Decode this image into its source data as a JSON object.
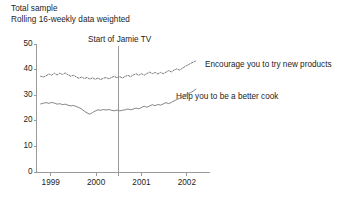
{
  "figure": {
    "background": "#ffffff",
    "ink": "#1d1d1d",
    "axis_color": "#9a9a9a",
    "series_color": "#777777",
    "annotation_color": "#9a9a9a"
  },
  "header": {
    "line1": "Total sample",
    "line2": "Rolling 16-weekly data weighted"
  },
  "annotation": {
    "label": "Start of Jamie TV",
    "x_value": 2000.5
  },
  "labels": {
    "series_0": "Encourage you to try new products",
    "series_1": "Help you to be a better cook"
  },
  "axes": {
    "y_ticks": [
      "0",
      "10",
      "20",
      "30",
      "40",
      "50"
    ],
    "y_tick_values": [
      0,
      10,
      20,
      30,
      40,
      50
    ],
    "x_ticks": [
      "1999",
      "2000",
      "2001",
      "2002"
    ],
    "x_tick_values": [
      1999,
      2000,
      2001,
      2002
    ],
    "ylim": [
      0,
      50
    ],
    "xlim": [
      1998.72,
      2002.4
    ]
  },
  "chart_data": {
    "type": "line",
    "title": "Total sample",
    "subtitle": "Rolling 16-weekly data weighted",
    "xlabel": "",
    "ylabel": "",
    "ylim": [
      0,
      50
    ],
    "xlim": [
      1998.72,
      2002.4
    ],
    "grid": false,
    "legend_position": "inline-right",
    "annotations": [
      {
        "type": "vline",
        "x": 2000.5,
        "label": "Start of Jamie TV"
      }
    ],
    "x": [
      1998.78,
      1998.84,
      1998.9,
      1998.96,
      1999.02,
      1999.08,
      1999.14,
      1999.2,
      1999.26,
      1999.32,
      1999.38,
      1999.44,
      1999.5,
      1999.56,
      1999.62,
      1999.68,
      1999.74,
      1999.8,
      1999.86,
      1999.92,
      1999.98,
      2000.04,
      2000.1,
      2000.16,
      2000.22,
      2000.28,
      2000.34,
      2000.4,
      2000.46,
      2000.52,
      2000.58,
      2000.64,
      2000.7,
      2000.76,
      2000.82,
      2000.88,
      2000.94,
      2001.0,
      2001.06,
      2001.12,
      2001.18,
      2001.24,
      2001.3,
      2001.36,
      2001.42,
      2001.48,
      2001.54,
      2001.6,
      2001.66,
      2001.72,
      2001.78,
      2001.84,
      2001.9,
      2001.96,
      2002.02,
      2002.08,
      2002.14,
      2002.2
    ],
    "series": [
      {
        "name": "Encourage you to try new products",
        "style": "dotted",
        "values": [
          37.4,
          37.1,
          37.6,
          38.3,
          37.8,
          38.6,
          37.9,
          38.6,
          38.1,
          38.7,
          38.0,
          37.4,
          37.8,
          37.2,
          36.6,
          37.1,
          36.5,
          36.9,
          36.3,
          36.8,
          36.2,
          36.7,
          36.1,
          36.6,
          36.9,
          36.4,
          36.9,
          37.4,
          36.8,
          37.3,
          36.7,
          37.3,
          37.8,
          37.2,
          37.9,
          38.4,
          37.8,
          38.4,
          37.8,
          38.5,
          39.0,
          38.4,
          38.9,
          38.3,
          38.9,
          38.4,
          39.0,
          39.6,
          39.1,
          39.8,
          40.3,
          39.8,
          40.5,
          41.2,
          41.8,
          42.4,
          42.9,
          43.4
        ]
      },
      {
        "name": "Help you to be a better cook",
        "style": "solid",
        "values": [
          26.6,
          26.9,
          27.1,
          26.8,
          27.2,
          26.9,
          26.5,
          26.7,
          26.3,
          26.5,
          26.1,
          25.8,
          26.0,
          25.6,
          25.2,
          24.6,
          23.8,
          23.1,
          22.6,
          23.2,
          23.8,
          24.3,
          24.1,
          24.4,
          24.2,
          24.4,
          24.1,
          23.9,
          24.2,
          23.9,
          24.1,
          24.3,
          24.6,
          24.3,
          24.6,
          25.0,
          24.7,
          25.2,
          25.7,
          25.3,
          25.8,
          26.3,
          25.9,
          26.4,
          26.1,
          26.6,
          27.1,
          26.7,
          27.2,
          27.8,
          28.3,
          28.8,
          29.3,
          29.9,
          30.4,
          31.0,
          31.6,
          32.4
        ]
      }
    ]
  }
}
